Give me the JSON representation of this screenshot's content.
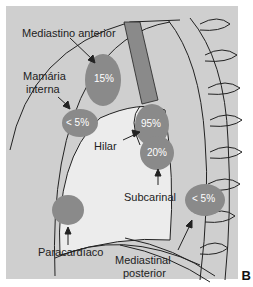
{
  "figure": {
    "panel_letter": "B",
    "labels": {
      "mediastino_anterior": "Mediastino anterior",
      "mamaria_interna_1": "Mamária",
      "mamaria_interna_2": "interna",
      "hilar": "Hilar",
      "subcarinal": "Subcarinal",
      "paracardiaco": "Paracardíaco",
      "mediastinal_posterior_1": "Mediastinal",
      "mediastinal_posterior_2": "posterior"
    },
    "percentages": {
      "mediastino_anterior": "15%",
      "mamaria_interna": "< 5%",
      "hilar": "95%",
      "subcarinal": "20%",
      "mediastinal_posterior": "< 5%"
    },
    "colors": {
      "background": "#cfcfcf",
      "node": "#8a8a8a",
      "lung": "#ececec",
      "line": "#222222"
    }
  }
}
